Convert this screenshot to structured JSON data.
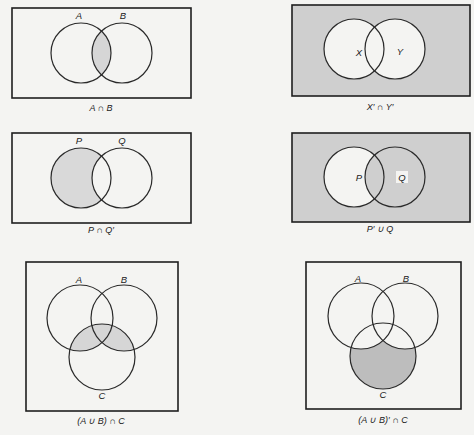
{
  "colors": {
    "background": "#f4f4f2",
    "shade": "#cfcfcf",
    "shade_dark": "#bdbdbd",
    "stroke": "#1e1e1e"
  },
  "diagrams": [
    {
      "caption": "A ∩ B",
      "sets": [
        "A",
        "B"
      ],
      "shaded_region": "intersection of A and B"
    },
    {
      "caption": "X′ ∩ Y′",
      "sets": [
        "X",
        "Y"
      ],
      "shaded_region": "outside both X and Y"
    },
    {
      "caption": "P ∩ Q′",
      "sets": [
        "P",
        "Q"
      ],
      "shaded_region": "P only (P minus Q)"
    },
    {
      "caption": "P′ ∪ Q",
      "sets": [
        "P",
        "Q"
      ],
      "shaded_region": "everything except P only"
    },
    {
      "caption": "(A ∪ B) ∩ C",
      "sets": [
        "A",
        "B",
        "C"
      ],
      "shaded_region": "part of C inside A or B"
    },
    {
      "caption": "(A ∪ B)′ ∩ C",
      "sets": [
        "A",
        "B",
        "C"
      ],
      "shaded_region": "C only (C outside A and B)"
    }
  ]
}
